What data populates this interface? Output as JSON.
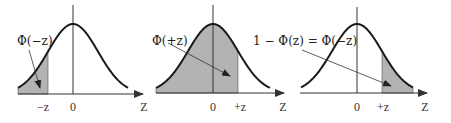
{
  "panels": [
    {
      "id": "left-tail",
      "label": "Φ(−z)",
      "shade": "left",
      "z": -1.0,
      "ticks": [
        "−z",
        "0"
      ],
      "axis_label": "Z"
    },
    {
      "id": "cumulative",
      "label": "Φ(+z)",
      "shade": "left",
      "z": 1.0,
      "ticks": [
        "0",
        "+z"
      ],
      "axis_label": "Z"
    },
    {
      "id": "right-tail",
      "label": "1 − Φ(z) = Φ(−z)",
      "shade": "right",
      "z": 1.0,
      "ticks": [
        "0",
        "+z"
      ],
      "axis_label": "Z"
    }
  ],
  "colors": {
    "curve": "#1a1a1a",
    "shade": "#b3b3b3",
    "axis": "#333333"
  }
}
